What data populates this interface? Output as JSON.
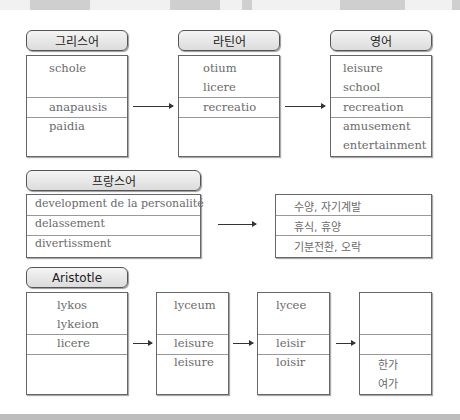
{
  "groups": {
    "greek": {
      "title": "그리스어",
      "words": [
        "schole",
        "anapausis",
        "paidia"
      ]
    },
    "latin": {
      "title": "라틴어",
      "words": [
        "otium",
        "licere",
        "recreatio"
      ]
    },
    "english": {
      "title": "영어",
      "words": [
        "leisure",
        "school",
        "recreation",
        "amusement",
        "entertainment"
      ]
    },
    "french": {
      "title": "프랑스어",
      "words": [
        "development de la personalité",
        "delassement",
        "divertissment"
      ]
    },
    "korean_meanings": {
      "words": [
        "수양, 자기계발",
        "휴식, 휴양",
        "기분전환, 오락"
      ]
    },
    "aristotle": {
      "title": "Aristotle",
      "words": [
        "lykos",
        "lykeion",
        "licere"
      ]
    },
    "chain_1": {
      "words": [
        "lyceum",
        "leisure",
        "leisure"
      ]
    },
    "chain_2": {
      "words": [
        "lycee",
        "leisir",
        "loisir"
      ]
    },
    "chain_3": {
      "words": [
        "한가",
        "여가"
      ]
    }
  },
  "colors": {
    "header_fill": "#dcdcdc",
    "border": "#555555",
    "text": "#6a6a6a"
  }
}
